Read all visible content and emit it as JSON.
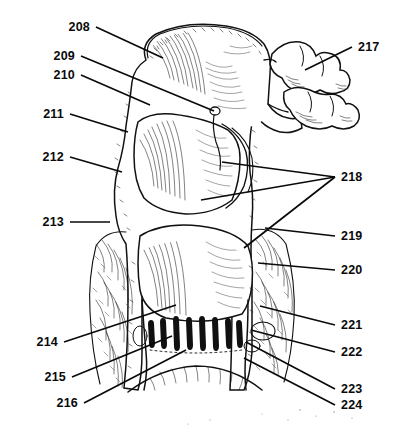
{
  "figure": {
    "kind": "anatomical-line-drawing",
    "background_color": "#ffffff",
    "ink_color": "#111111",
    "width": 393,
    "height": 431
  },
  "labels": {
    "left": [
      {
        "id": "208",
        "text": "208",
        "text_x": 90,
        "text_y": 31,
        "line": [
          [
            96,
            27
          ],
          [
            163,
            58
          ]
        ]
      },
      {
        "id": "209",
        "text": "209",
        "text_x": 75,
        "text_y": 60,
        "line": [
          [
            81,
            56
          ],
          [
            214,
            111
          ]
        ]
      },
      {
        "id": "210",
        "text": "210",
        "text_x": 75,
        "text_y": 79,
        "line": [
          [
            81,
            75
          ],
          [
            150,
            105
          ]
        ]
      },
      {
        "id": "211",
        "text": "211",
        "text_x": 64,
        "text_y": 118,
        "line": [
          [
            70,
            114
          ],
          [
            128,
            132
          ]
        ]
      },
      {
        "id": "212",
        "text": "212",
        "text_x": 64,
        "text_y": 161,
        "line": [
          [
            70,
            157
          ],
          [
            122,
            172
          ]
        ]
      },
      {
        "id": "213",
        "text": "213",
        "text_x": 64,
        "text_y": 226,
        "line": [
          [
            70,
            222
          ],
          [
            110,
            222
          ]
        ]
      },
      {
        "id": "214",
        "text": "214",
        "text_x": 58,
        "text_y": 346,
        "line": [
          [
            64,
            342
          ],
          [
            176,
            305
          ]
        ]
      },
      {
        "id": "215",
        "text": "215",
        "text_x": 66,
        "text_y": 381,
        "line": [
          [
            72,
            377
          ],
          [
            172,
            336
          ]
        ]
      },
      {
        "id": "216",
        "text": "216",
        "text_x": 78,
        "text_y": 407,
        "line": [
          [
            84,
            403
          ],
          [
            186,
            350
          ]
        ]
      }
    ],
    "right": [
      {
        "id": "217",
        "text": "217",
        "text_x": 358,
        "text_y": 51,
        "line": [
          [
            352,
            47
          ],
          [
            305,
            70
          ]
        ]
      },
      {
        "id": "218",
        "text": "218",
        "text_x": 341,
        "text_y": 181,
        "line_fan": [
          [
            [
              335,
              177
            ],
            [
              222,
              162
            ]
          ],
          [
            [
              335,
              177
            ],
            [
              201,
              200
            ]
          ],
          [
            [
              335,
              177
            ],
            [
              244,
              248
            ]
          ]
        ]
      },
      {
        "id": "219",
        "text": "219",
        "text_x": 341,
        "text_y": 240,
        "line": [
          [
            335,
            236
          ],
          [
            265,
            228
          ]
        ]
      },
      {
        "id": "220",
        "text": "220",
        "text_x": 341,
        "text_y": 274,
        "line": [
          [
            335,
            270
          ],
          [
            258,
            263
          ]
        ]
      },
      {
        "id": "221",
        "text": "221",
        "text_x": 341,
        "text_y": 329,
        "line": [
          [
            335,
            325
          ],
          [
            260,
            306
          ]
        ]
      },
      {
        "id": "222",
        "text": "222",
        "text_x": 341,
        "text_y": 356,
        "line": [
          [
            335,
            352
          ],
          [
            251,
            330
          ]
        ]
      },
      {
        "id": "223",
        "text": "223",
        "text_x": 341,
        "text_y": 393,
        "line": [
          [
            335,
            389
          ],
          [
            246,
            342
          ]
        ]
      },
      {
        "id": "224",
        "text": "224",
        "text_x": 341,
        "text_y": 409,
        "line": [
          [
            335,
            405
          ],
          [
            244,
            358
          ]
        ]
      }
    ]
  }
}
